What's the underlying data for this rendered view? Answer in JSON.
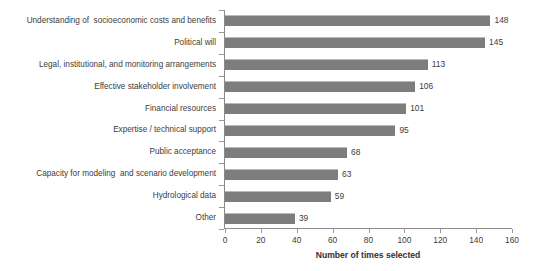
{
  "chart_data": {
    "type": "bar",
    "orientation": "horizontal",
    "title": "",
    "xlabel": "Number of times selected",
    "ylabel": "",
    "xlim": [
      0,
      160
    ],
    "xticks": [
      0,
      20,
      40,
      60,
      80,
      100,
      120,
      140,
      160
    ],
    "grid": false,
    "legend": null,
    "bar_color": "#7d7d7d",
    "categories": [
      "Understanding of  socioeconomic costs and benefits",
      "Political will",
      "Legal, institutional, and monitoring arrangements",
      "Effective stakeholder involvement",
      "Financial resources",
      "Expertise / technical support",
      "Public acceptance",
      "Capacity for modeling  and scenario development",
      "Hydrological data",
      "Other"
    ],
    "values": [
      148,
      145,
      113,
      106,
      101,
      95,
      68,
      63,
      59,
      39
    ],
    "value_labels": [
      "148",
      "145",
      "113",
      "106",
      "101",
      "95",
      "68",
      "63",
      "59",
      "39"
    ],
    "xtick_labels": [
      "0",
      "20",
      "40",
      "60",
      "80",
      "100",
      "120",
      "140",
      "160"
    ]
  }
}
